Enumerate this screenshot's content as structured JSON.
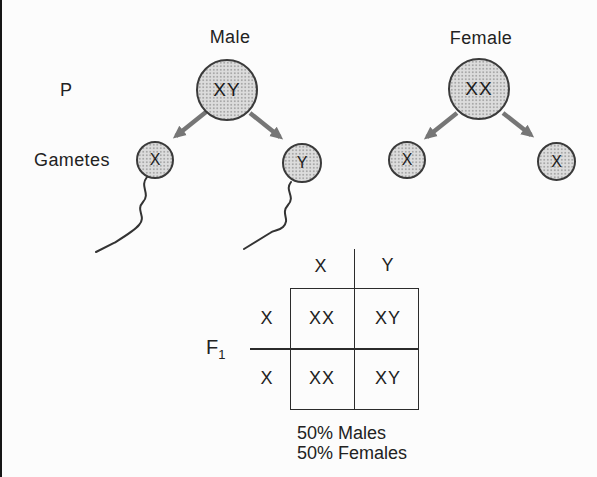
{
  "labels": {
    "male": "Male",
    "female": "Female",
    "p_generation": "P",
    "gametes": "Gametes",
    "f1_base": "F",
    "f1_sub": "1"
  },
  "parents": {
    "male": {
      "genotype": "XY",
      "gametes": [
        "X",
        "Y"
      ]
    },
    "female": {
      "genotype": "XX",
      "gametes": [
        "X",
        "X"
      ]
    }
  },
  "punnett": {
    "col_headers": [
      "X",
      "Y"
    ],
    "row_headers": [
      "X",
      "X"
    ],
    "cells": [
      [
        "XX",
        "XY"
      ],
      [
        "XX",
        "XY"
      ]
    ]
  },
  "results": {
    "line1": "50% Males",
    "line2": "50% Females"
  },
  "colors": {
    "background": "#fcfcfc",
    "circle_fill": "#dcdcdc",
    "circle_stroke": "#3a3a3a",
    "arrow": "#767676",
    "line": "#2b2b2b",
    "text": "#222222"
  }
}
